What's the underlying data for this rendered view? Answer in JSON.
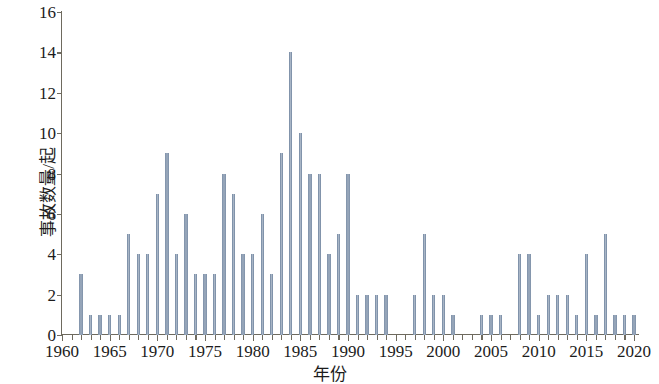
{
  "chart_data": {
    "type": "bar",
    "title": "",
    "xlabel": "年份",
    "ylabel": "事故数量/起",
    "xlim": [
      1960,
      2020
    ],
    "ylim": [
      0,
      16
    ],
    "yticks": [
      0,
      2,
      4,
      6,
      8,
      10,
      12,
      14,
      16
    ],
    "xticks": [
      1960,
      1965,
      1970,
      1975,
      1980,
      1985,
      1990,
      1995,
      2000,
      2005,
      2010,
      2015,
      2020
    ],
    "xtick_step_minor": 1,
    "grid": false,
    "legend": null,
    "bar_color": "#7d90a8",
    "axis_color": "#6e6a5e",
    "background": "#ffffff",
    "categories": [
      1960,
      1961,
      1962,
      1963,
      1964,
      1965,
      1966,
      1967,
      1968,
      1969,
      1970,
      1971,
      1972,
      1973,
      1974,
      1975,
      1976,
      1977,
      1978,
      1979,
      1980,
      1981,
      1982,
      1983,
      1984,
      1985,
      1986,
      1987,
      1988,
      1989,
      1990,
      1991,
      1992,
      1993,
      1994,
      1995,
      1996,
      1997,
      1998,
      1999,
      2000,
      2001,
      2002,
      2003,
      2004,
      2005,
      2006,
      2007,
      2008,
      2009,
      2010,
      2011,
      2012,
      2013,
      2014,
      2015,
      2016,
      2017,
      2018,
      2019,
      2020
    ],
    "values": [
      0,
      0,
      3,
      1,
      1,
      1,
      1,
      5,
      4,
      4,
      7,
      9,
      4,
      6,
      3,
      3,
      3,
      8,
      7,
      4,
      4,
      6,
      3,
      9,
      14,
      10,
      8,
      8,
      4,
      5,
      8,
      2,
      2,
      2,
      2,
      0,
      0,
      2,
      5,
      2,
      2,
      1,
      0,
      0,
      1,
      1,
      1,
      0,
      4,
      4,
      1,
      2,
      2,
      2,
      1,
      4,
      1,
      5,
      1,
      1,
      1
    ]
  }
}
